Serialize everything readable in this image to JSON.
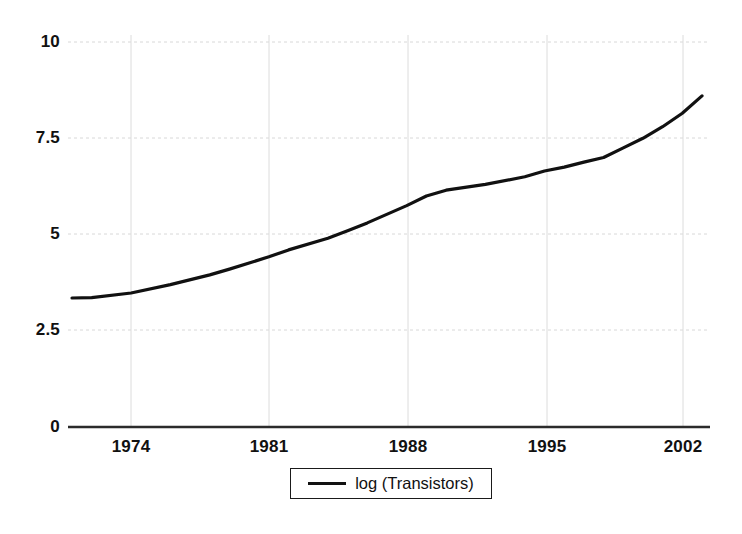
{
  "chart_data": {
    "type": "line",
    "title": "",
    "subtitle": "",
    "xlabel": "",
    "ylabel": "",
    "xlim": [
      1971,
      2003
    ],
    "ylim": [
      0,
      10
    ],
    "grid": true,
    "legend_position": "bottom-center",
    "x_ticks": [
      "1974",
      "1981",
      "1988",
      "1995",
      "2002"
    ],
    "x_tick_values": [
      1974,
      1981,
      1988,
      1995,
      2002
    ],
    "y_ticks": [
      "0",
      "2.5",
      "5",
      "7.5",
      "10"
    ],
    "y_tick_values": [
      0,
      2.5,
      5,
      7.5,
      10
    ],
    "series": [
      {
        "name": "log (Transistors)",
        "color": "#111111",
        "x": [
          1971,
          1972,
          1974,
          1976,
          1978,
          1979,
          1981,
          1982,
          1984,
          1985,
          1986,
          1988,
          1989,
          1990,
          1992,
          1994,
          1995,
          1996,
          1997,
          1998,
          1999,
          2000,
          2001,
          2002,
          2003
        ],
        "values": [
          3.35,
          3.36,
          3.48,
          3.7,
          3.95,
          4.1,
          4.42,
          4.6,
          4.9,
          5.1,
          5.3,
          5.75,
          6.0,
          6.15,
          6.3,
          6.5,
          6.65,
          6.75,
          6.88,
          7.0,
          7.25,
          7.5,
          7.8,
          8.15,
          8.6
        ]
      }
    ]
  },
  "legend": {
    "entries": [
      {
        "label": "log (Transistors)",
        "marker": "line-marker",
        "color": "#111111"
      }
    ]
  },
  "axes": {
    "y_axis_label_0": "0",
    "y_axis_label_1": "2.5",
    "y_axis_label_2": "5",
    "y_axis_label_3": "7.5",
    "y_axis_label_4": "10",
    "x_axis_label_0": "1974",
    "x_axis_label_1": "1981",
    "x_axis_label_2": "1988",
    "x_axis_label_3": "1995",
    "x_axis_label_4": "2002"
  },
  "colors": {
    "line": "#111111",
    "grid": "#d8d8d8",
    "axis": "#333333",
    "text": "#111111",
    "background": "#ffffff"
  }
}
